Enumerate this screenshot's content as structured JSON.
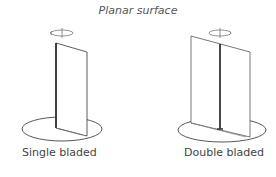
{
  "title": "Planar surface",
  "figures": [
    {
      "label": "Single bladed",
      "type": "single-blade"
    },
    {
      "label": "Double bladed",
      "type": "double-blade"
    }
  ],
  "colors": {
    "line": "#333333",
    "light_line": "#777777",
    "text": "#444444"
  }
}
